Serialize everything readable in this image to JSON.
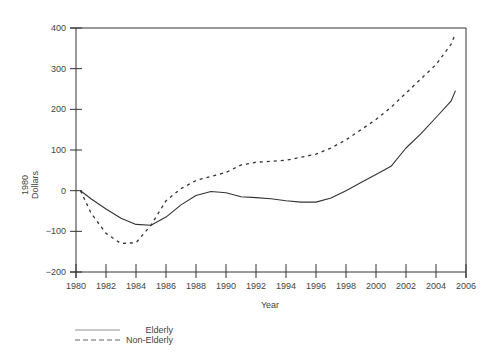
{
  "chart_data": {
    "type": "line",
    "title": "",
    "xlabel": "Year",
    "ylabel": "1980 Dollars",
    "xlim": [
      1980,
      2006
    ],
    "ylim": [
      -200,
      400
    ],
    "x_ticks": [
      "1980",
      "1982",
      "1984",
      "1986",
      "1988",
      "1990",
      "1992",
      "1994",
      "1996",
      "1998",
      "2000",
      "2002",
      "2004",
      "2006"
    ],
    "y_ticks": [
      "400",
      "300",
      "200",
      "100",
      "0",
      "−100",
      "−200"
    ],
    "grid": false,
    "legend_position": "bottom-left",
    "series": [
      {
        "name": "Elderly",
        "style": "solid",
        "x": [
          1980.3,
          1981,
          1982,
          1983,
          1984,
          1985,
          1986,
          1987,
          1988,
          1989,
          1990,
          1991,
          1992,
          1993,
          1994,
          1995,
          1996,
          1997,
          1998,
          1999,
          2000,
          2001,
          2002,
          2003,
          2004,
          2005,
          2005.3
        ],
        "values": [
          0,
          -20,
          -45,
          -68,
          -83,
          -85,
          -65,
          -35,
          -12,
          -2,
          -5,
          -15,
          -17,
          -20,
          -25,
          -28,
          -28,
          -18,
          0,
          20,
          40,
          60,
          105,
          140,
          180,
          220,
          246
        ]
      },
      {
        "name": "Non-Elderly",
        "style": "dashed",
        "x": [
          1980.3,
          1981,
          1982,
          1983,
          1984,
          1985,
          1986,
          1987,
          1988,
          1989,
          1990,
          1991,
          1992,
          1993,
          1994,
          1995,
          1996,
          1997,
          1998,
          1999,
          2000,
          2001,
          2002,
          2003,
          2004,
          2005,
          2005.3
        ],
        "values": [
          0,
          -55,
          -105,
          -130,
          -128,
          -85,
          -25,
          5,
          25,
          35,
          45,
          63,
          70,
          72,
          75,
          82,
          90,
          105,
          125,
          150,
          175,
          205,
          240,
          275,
          310,
          360,
          387
        ]
      }
    ]
  },
  "legend": {
    "items": [
      {
        "label": "Elderly",
        "style": "solid"
      },
      {
        "label": "Non-Elderly",
        "style": "dashed"
      }
    ]
  },
  "axis": {
    "x_title": "Year",
    "y_title_line1": "1980",
    "y_title_line2": "Dollars"
  },
  "colors": {
    "line": "#333333",
    "axis": "#333333"
  }
}
